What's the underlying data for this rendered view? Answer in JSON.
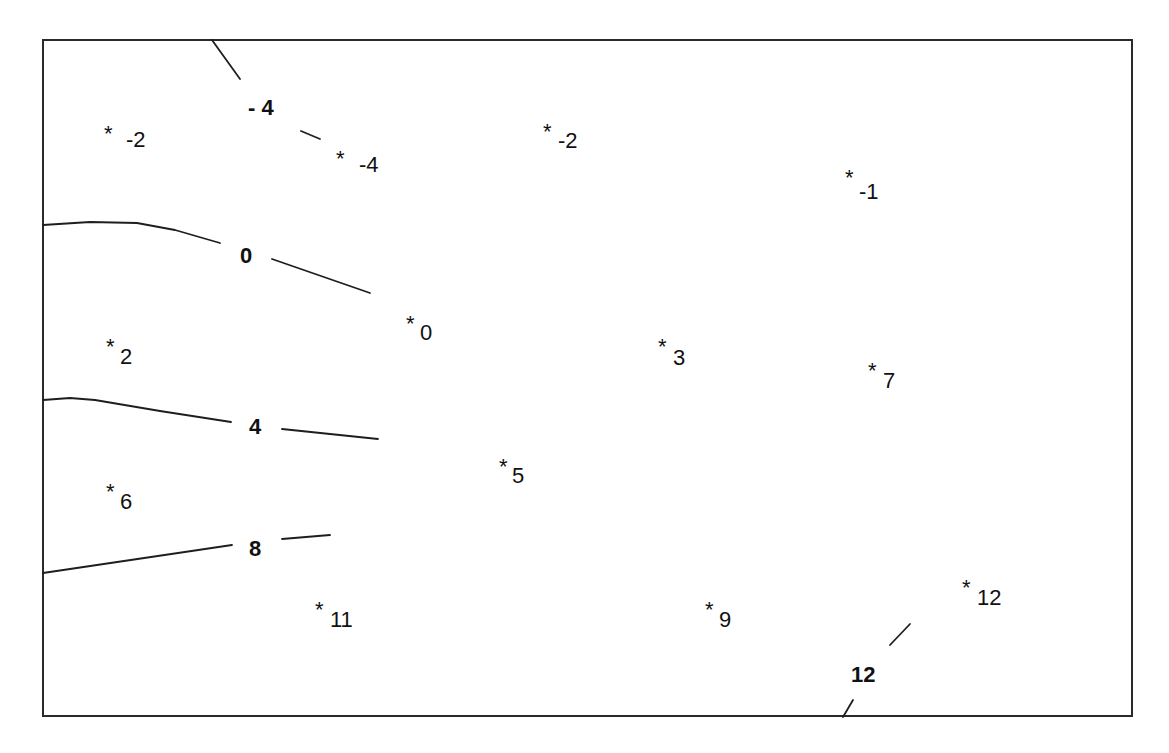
{
  "caption_fragment": "",
  "chart_data": {
    "type": "contour",
    "title": "",
    "xlabel": "",
    "ylabel": "",
    "grid": false,
    "legend": null,
    "frame": {
      "x1": 43,
      "y1": 40,
      "x2": 1132,
      "y2": 716
    },
    "contour_levels": [
      -4,
      0,
      4,
      8,
      12
    ],
    "contours": [
      {
        "level": -4,
        "label": "- 4",
        "label_pos": [
          248,
          115
        ],
        "segments": [
          [
            [
              212,
              40
            ],
            [
              240,
              79
            ]
          ],
          [
            [
              301,
              131
            ],
            [
              320,
              139
            ]
          ]
        ]
      },
      {
        "level": 0,
        "label": "0",
        "label_pos": [
          240,
          263
        ],
        "segments": [
          [
            [
              43,
              225
            ],
            [
              90,
              222
            ],
            [
              137,
              223
            ],
            [
              175,
              230
            ],
            [
              220,
              243
            ]
          ],
          [
            [
              272,
              259
            ],
            [
              370,
              293
            ]
          ]
        ]
      },
      {
        "level": 4,
        "label": "4",
        "label_pos": [
          249,
          434
        ],
        "segments": [
          [
            [
              43,
              400
            ],
            [
              70,
              398
            ],
            [
              95,
              400
            ],
            [
              160,
              411
            ],
            [
              231,
              422
            ]
          ],
          [
            [
              282,
              429
            ],
            [
              330,
              434
            ],
            [
              378,
              439
            ]
          ]
        ]
      },
      {
        "level": 8,
        "label": "8",
        "label_pos": [
          249,
          556
        ],
        "segments": [
          [
            [
              43,
              573
            ],
            [
              232,
              545
            ]
          ],
          [
            [
              282,
              539
            ],
            [
              330,
              535
            ]
          ]
        ]
      },
      {
        "level": 12,
        "label": "12",
        "label_pos": [
          851,
          682
        ],
        "segments": [
          [
            [
              910,
              624
            ],
            [
              890,
              645
            ]
          ],
          [
            [
              853,
              700
            ],
            [
              843,
              717
            ]
          ]
        ]
      }
    ],
    "points": [
      {
        "value": -2,
        "label": "-2",
        "star": [
          104,
          127
        ],
        "text": [
          126,
          140
        ],
        "subscript": false
      },
      {
        "value": -4,
        "label": "-4",
        "star": [
          336,
          152
        ],
        "text": [
          359,
          165
        ],
        "subscript": false
      },
      {
        "value": -2,
        "label": "-2",
        "star": [
          543,
          125
        ],
        "text": [
          558,
          141
        ],
        "subscript": true
      },
      {
        "value": -1,
        "label": "-1",
        "star": [
          845,
          171
        ],
        "text": [
          859,
          192
        ],
        "subscript": true
      },
      {
        "value": 2,
        "label": "2",
        "star": [
          106,
          340
        ],
        "text": [
          120,
          357
        ],
        "subscript": true
      },
      {
        "value": 0,
        "label": "0",
        "star": [
          406,
          317
        ],
        "text": [
          420,
          333
        ],
        "subscript": true
      },
      {
        "value": 3,
        "label": "3",
        "star": [
          658,
          340
        ],
        "text": [
          673,
          358
        ],
        "subscript": true
      },
      {
        "value": 7,
        "label": "7",
        "star": [
          868,
          364
        ],
        "text": [
          883,
          381
        ],
        "subscript": true
      },
      {
        "value": 6,
        "label": "6",
        "star": [
          106,
          485
        ],
        "text": [
          120,
          502
        ],
        "subscript": true
      },
      {
        "value": 5,
        "label": "5",
        "star": [
          499,
          460
        ],
        "text": [
          512,
          476
        ],
        "subscript": true
      },
      {
        "value": 11,
        "label": "11",
        "star": [
          315,
          603
        ],
        "text": [
          330,
          620
        ],
        "subscript": true
      },
      {
        "value": 9,
        "label": "9",
        "star": [
          705,
          603
        ],
        "text": [
          719,
          620
        ],
        "subscript": true
      },
      {
        "value": 12,
        "label": "12",
        "star": [
          962,
          581
        ],
        "text": [
          977,
          598
        ],
        "subscript": true
      }
    ]
  }
}
